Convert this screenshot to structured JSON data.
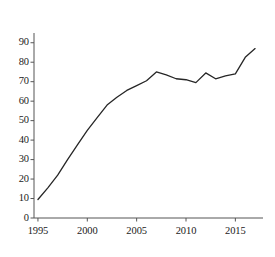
{
  "chart_data": {
    "type": "line",
    "title": "",
    "subtitle": "",
    "xlabel": "",
    "ylabel": "",
    "xlim": [
      1994.6,
      2017.8
    ],
    "ylim": [
      0,
      95
    ],
    "grid": false,
    "legend": null,
    "legend_position": "none",
    "annotations": [],
    "line_color": "#262626",
    "line_width": 1.3,
    "axis_color": "#555555",
    "background_color": "#ffffff",
    "y_ticks": [
      0,
      10,
      20,
      30,
      40,
      50,
      60,
      70,
      80,
      90
    ],
    "y_tick_labels": [
      "0",
      "10",
      "20",
      "30",
      "40",
      "50",
      "60",
      "70",
      "80",
      "90"
    ],
    "x_ticks": [
      1995,
      2000,
      2005,
      2010,
      2015
    ],
    "x_tick_labels": [
      "1995",
      "2000",
      "2005",
      "2010",
      "2015"
    ],
    "x_minor_ticks": [
      1996,
      1997,
      1998,
      1999,
      2001,
      2002,
      2003,
      2004,
      2006,
      2007,
      2008,
      2009,
      2011,
      2012,
      2013,
      2014,
      2016,
      2017
    ],
    "series": [
      {
        "name": "series-1",
        "x": [
          1995,
          1996,
          1997,
          1998,
          1999,
          2000,
          2001,
          2002,
          2003,
          2004,
          2005,
          2006,
          2007,
          2008,
          2009,
          2010,
          2011,
          2012,
          2013,
          2014,
          2015,
          2016,
          2017
        ],
        "values": [
          9.5,
          15.5,
          22,
          30,
          37.5,
          45,
          51.5,
          58,
          62,
          65.5,
          68,
          70.5,
          75,
          73.5,
          71.5,
          71,
          69.5,
          74.5,
          71.5,
          73,
          74,
          82.5,
          87
        ]
      }
    ]
  }
}
